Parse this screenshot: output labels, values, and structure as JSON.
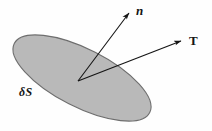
{
  "figure": {
    "background_color": "#fefefe",
    "width": 212,
    "height": 131
  },
  "surface": {
    "name": "surface-element",
    "label": "δS",
    "fill_color": "#b9b9b9",
    "stroke_color": "#6e6e6e",
    "center_x": 82,
    "center_y": 78,
    "radius_x": 76,
    "radius_y": 29,
    "rotation_deg": 27
  },
  "origin": {
    "x": 78,
    "y": 81
  },
  "vectors": [
    {
      "name": "normal-vector",
      "label": "n",
      "label_style": "bold-italic",
      "from_x": 78,
      "from_y": 81,
      "to_x": 131,
      "to_y": 11,
      "color": "#151515"
    },
    {
      "name": "traction-vector",
      "label": "T",
      "label_style": "bold-upright",
      "from_x": 78,
      "from_y": 81,
      "to_x": 184,
      "to_y": 40,
      "color": "#151515"
    }
  ],
  "labels": {
    "normal": "n",
    "traction": "T",
    "surface": "δS"
  }
}
